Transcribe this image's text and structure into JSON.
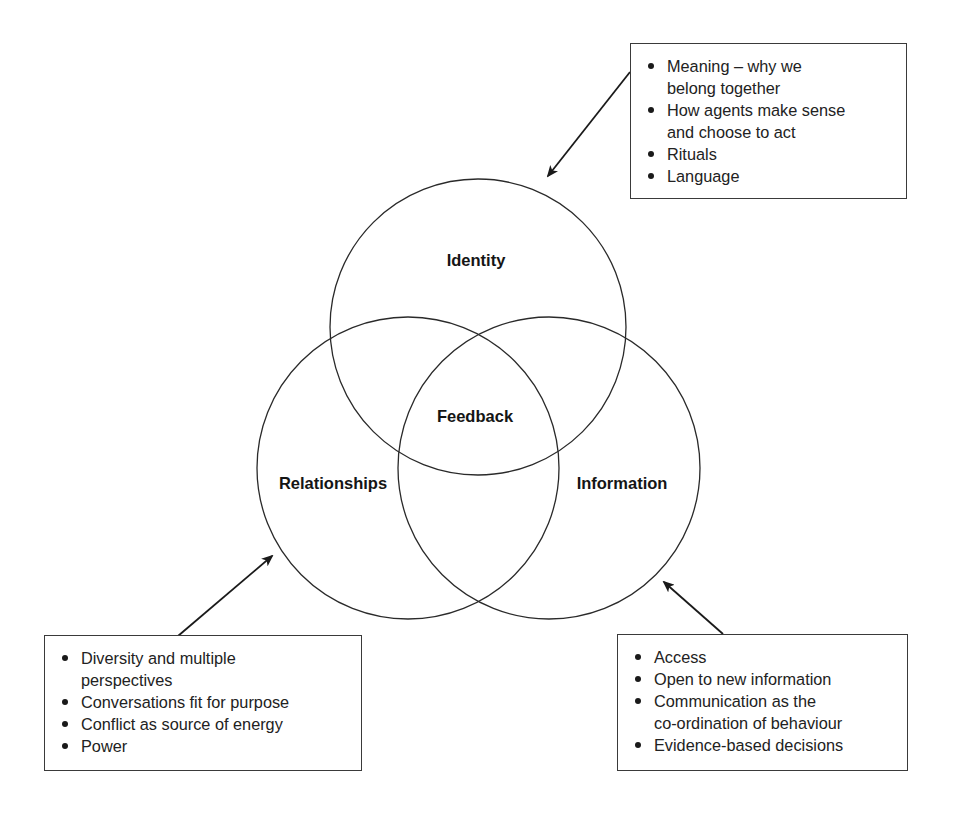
{
  "diagram": {
    "type": "venn-diagram",
    "circles": [
      {
        "id": "identity",
        "label": "Identity",
        "cx": 478,
        "cy": 327,
        "r": 148
      },
      {
        "id": "relationships",
        "label": "Relationships",
        "cx": 408,
        "cy": 468,
        "r": 151
      },
      {
        "id": "information",
        "label": "Information",
        "cx": 549,
        "cy": 468,
        "r": 151
      }
    ],
    "center_label": "Feedback",
    "line_color": "#2a2a2a",
    "text_color": "#151515"
  },
  "labels": {
    "identity": "Identity",
    "feedback": "Feedback",
    "relationships": "Relationships",
    "information": "Information"
  },
  "boxes": {
    "identity_notes": {
      "items": [
        "Meaning – why we belong together",
        "How agents make sense and choose to act",
        "Rituals",
        "Language"
      ],
      "lines": [
        "Meaning – why we",
        "belong together",
        "How agents make sense",
        "and choose to act",
        "Rituals",
        "Language"
      ]
    },
    "relationships_notes": {
      "items": [
        "Diversity and multiple perspectives",
        "Conversations fit for purpose",
        "Conflict as source of energy",
        "Power"
      ],
      "lines": [
        "Diversity and multiple",
        "perspectives",
        "Conversations fit for purpose",
        "Conflict as source of energy",
        "Power"
      ]
    },
    "information_notes": {
      "items": [
        "Access",
        "Open to new information",
        "Communication as the co-ordination of behaviour",
        "Evidence-based decisions"
      ],
      "lines": [
        "Access",
        "Open to new information",
        "Communication as the",
        "co-ordination of behaviour",
        "Evidence-based decisions"
      ]
    }
  },
  "arrows": [
    {
      "id": "arrow-to-identity",
      "from": [
        630,
        72
      ],
      "to": [
        548,
        176
      ]
    },
    {
      "id": "arrow-to-relationships",
      "from": [
        178,
        636
      ],
      "to": [
        272,
        556
      ]
    },
    {
      "id": "arrow-to-information",
      "from": [
        723,
        634
      ],
      "to": [
        664,
        582
      ]
    }
  ]
}
